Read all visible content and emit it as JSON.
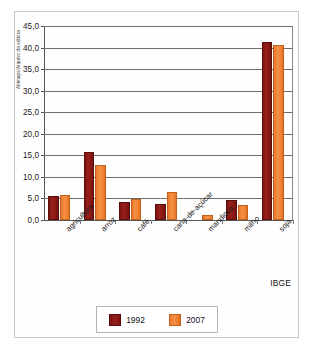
{
  "figure": {
    "credit_label": "Abimaps/Arquivo da editora",
    "source_label": "IBGE"
  },
  "chart_data": {
    "type": "bar",
    "title": "",
    "subtitle": "",
    "xlabel": "",
    "ylabel": "",
    "categories": [
      "agricultura",
      "arroz",
      "café",
      "cana-de-açúcar",
      "mandioca",
      "milho",
      "soja"
    ],
    "series": [
      {
        "name": "1992",
        "color": "#8B1A14",
        "values": [
          5.5,
          15.8,
          4.2,
          3.7,
          0.0,
          4.7,
          41.2
        ]
      },
      {
        "name": "2007",
        "color": "#F08030",
        "values": [
          5.8,
          12.7,
          4.8,
          6.5,
          1.2,
          3.4,
          40.7
        ]
      }
    ],
    "ylim": [
      0,
      45
    ],
    "ytick_step": 5,
    "ytick_labels": [
      "0,0",
      "5,0",
      "10,0",
      "15,0",
      "20,0",
      "25,0",
      "30,0",
      "35,0",
      "40,0",
      "45,0"
    ],
    "grid": true,
    "legend_position": "bottom",
    "decimal_separator": ","
  }
}
